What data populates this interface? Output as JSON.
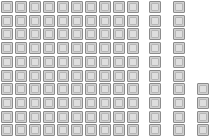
{
  "canvas": {
    "width": 216,
    "height": 137,
    "background_color": "#ffffff"
  },
  "cell_style": {
    "size": 12,
    "fill_color": "#cfcfcf",
    "border_color": "#8c8c8c",
    "inner_fill_color": "#dedede",
    "inner_border_color": "#b6b6b6"
  },
  "grid": {
    "row_count": 10,
    "column_count": 13,
    "row_pitch": 13.7,
    "row_origin_y": 1,
    "column_x_positions": [
      1,
      15,
      29,
      43,
      57,
      71,
      85,
      99,
      113,
      127,
      149,
      173,
      197
    ],
    "gap_after_column_index": 9,
    "total_cell_count": 124
  },
  "columns": [
    {
      "index": 1,
      "x": 1,
      "cell_count": 10,
      "first_row": 1
    },
    {
      "index": 2,
      "x": 15,
      "cell_count": 10,
      "first_row": 1
    },
    {
      "index": 3,
      "x": 29,
      "cell_count": 10,
      "first_row": 1
    },
    {
      "index": 4,
      "x": 43,
      "cell_count": 10,
      "first_row": 1
    },
    {
      "index": 5,
      "x": 57,
      "cell_count": 10,
      "first_row": 1
    },
    {
      "index": 6,
      "x": 71,
      "cell_count": 10,
      "first_row": 1
    },
    {
      "index": 7,
      "x": 85,
      "cell_count": 10,
      "first_row": 1
    },
    {
      "index": 8,
      "x": 99,
      "cell_count": 10,
      "first_row": 1
    },
    {
      "index": 9,
      "x": 113,
      "cell_count": 10,
      "first_row": 1
    },
    {
      "index": 10,
      "x": 127,
      "cell_count": 10,
      "first_row": 1
    },
    {
      "index": 11,
      "x": 149,
      "cell_count": 10,
      "first_row": 1
    },
    {
      "index": 12,
      "x": 173,
      "cell_count": 10,
      "first_row": 1
    },
    {
      "index": 13,
      "x": 197,
      "cell_count": 4,
      "first_row": 7
    }
  ]
}
